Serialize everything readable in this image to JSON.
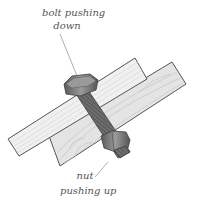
{
  "diagram": {
    "labels": {
      "bolt_line1": "bolt pushing",
      "bolt_line2": "down",
      "nut_line1": "nut",
      "nut_line2": "pushing up"
    },
    "colors": {
      "background": "#ffffff",
      "wood_light": "#eeeeee",
      "wood_grain": "#cfcfcf",
      "wood_dark": "#e2e2e2",
      "outline": "#555555",
      "metal": "#7a7a7a",
      "metal_dark": "#4a4a4a",
      "text": "#555555"
    }
  }
}
